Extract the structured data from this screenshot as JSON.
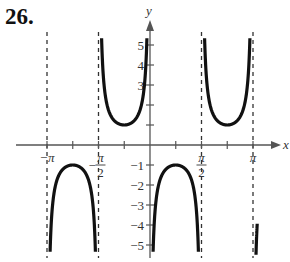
{
  "problem_number": "26.",
  "chart_data": {
    "type": "line",
    "title": "",
    "function": "y = -csc(2x)",
    "xlabel": "x",
    "ylabel": "y",
    "xlim": [
      -3.25,
      3.85
    ],
    "ylim": [
      -5.5,
      5.5
    ],
    "grid": false,
    "x_ticks": [
      {
        "value": -3.14159,
        "label": "−π"
      },
      {
        "value": -2.35619,
        "label": ""
      },
      {
        "value": -1.5708,
        "label": "−π/2"
      },
      {
        "value": -0.7854,
        "label": ""
      },
      {
        "value": 0.7854,
        "label": ""
      },
      {
        "value": 1.5708,
        "label": "π/2"
      },
      {
        "value": 2.35619,
        "label": ""
      },
      {
        "value": 3.14159,
        "label": "π"
      }
    ],
    "y_ticks": [
      {
        "value": 5,
        "label": "5"
      },
      {
        "value": 4,
        "label": "4"
      },
      {
        "value": 3,
        "label": "3"
      },
      {
        "value": 2,
        "label": ""
      },
      {
        "value": 1,
        "label": ""
      },
      {
        "value": -1,
        "label": "−1"
      },
      {
        "value": -2,
        "label": "−2"
      },
      {
        "value": -3,
        "label": "−3"
      },
      {
        "value": -4,
        "label": "−4"
      },
      {
        "value": -5,
        "label": "−5"
      }
    ],
    "asymptotes_x": [
      -3.14159,
      -1.5708,
      1.5708,
      3.14159
    ],
    "branches": [
      {
        "x_start": -3.25,
        "x_end": -3.1416,
        "note": "rising to +inf near -π"
      },
      {
        "x_start": -3.1416,
        "x_end": -1.5708,
        "extremum": {
          "x": -2.35619,
          "y": -1
        }
      },
      {
        "x_start": -1.5708,
        "x_end": 0,
        "extremum": {
          "x": -0.7854,
          "y": 1
        }
      },
      {
        "x_start": 0,
        "x_end": 1.5708,
        "extremum": {
          "x": 0.7854,
          "y": -1
        }
      },
      {
        "x_start": 1.5708,
        "x_end": 3.1416,
        "extremum": {
          "x": 2.35619,
          "y": 1
        }
      },
      {
        "x_start": 3.1416,
        "x_end": 3.25,
        "note": "rising from -inf after π"
      }
    ],
    "key_points": [
      {
        "x": -2.35619,
        "y": -1
      },
      {
        "x": -0.7854,
        "y": 1
      },
      {
        "x": 0.7854,
        "y": -1
      },
      {
        "x": 2.35619,
        "y": 1
      }
    ]
  },
  "colors": {
    "curve": "#111111",
    "axis": "#555555",
    "asymptote": "#333333"
  }
}
